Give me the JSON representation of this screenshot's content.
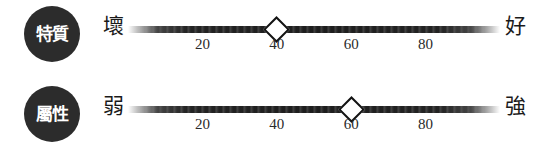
{
  "background_color": "#ffffff",
  "badge_color": "#2c2c2c",
  "track_color": "#232323",
  "marker_color": "#ffffff",
  "marker_outline_color": "#131313",
  "scales": [
    {
      "badge_label": "特質",
      "low_anchor": "壞",
      "high_anchor": "好",
      "value": 40,
      "ticks": [
        "20",
        "40",
        "60",
        "80"
      ],
      "tick_values": [
        20,
        40,
        60,
        80
      ]
    },
    {
      "badge_label": "屬性",
      "low_anchor": "弱",
      "high_anchor": "強",
      "value": 60,
      "ticks": [
        "20",
        "40",
        "60",
        "80"
      ],
      "tick_values": [
        20,
        40,
        60,
        80
      ]
    }
  ]
}
